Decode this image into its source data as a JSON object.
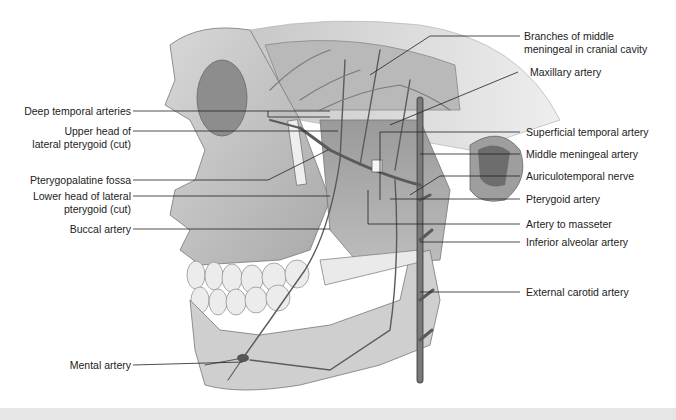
{
  "figure": {
    "type": "anatomical-illustration",
    "labels_left": [
      {
        "id": "deep-temporal",
        "lines": [
          "Deep temporal arteries"
        ]
      },
      {
        "id": "upper-head",
        "lines": [
          "Upper head of",
          "lateral pterygoid (cut)"
        ]
      },
      {
        "id": "pterygopalatine",
        "lines": [
          "Pterygopalatine fossa"
        ]
      },
      {
        "id": "lower-head",
        "lines": [
          "Lower head of lateral",
          "pterygoid (cut)"
        ]
      },
      {
        "id": "buccal",
        "lines": [
          "Buccal artery"
        ]
      },
      {
        "id": "mental",
        "lines": [
          "Mental artery"
        ]
      }
    ],
    "labels_right": [
      {
        "id": "branches-mm",
        "lines": [
          "Branches of middle",
          "meningeal in cranial cavity"
        ]
      },
      {
        "id": "maxillary",
        "lines": [
          "Maxillary artery"
        ]
      },
      {
        "id": "superficial-temporal",
        "lines": [
          "Superficial temporal artery"
        ]
      },
      {
        "id": "middle-meningeal",
        "lines": [
          "Middle meningeal artery"
        ]
      },
      {
        "id": "auriculotemporal",
        "lines": [
          "Auriculotemporal nerve"
        ]
      },
      {
        "id": "pterygoid",
        "lines": [
          "Pterygoid artery"
        ]
      },
      {
        "id": "masseter",
        "lines": [
          "Artery to masseter"
        ]
      },
      {
        "id": "inferior-alveolar",
        "lines": [
          "Inferior alveolar artery"
        ]
      },
      {
        "id": "external-carotid",
        "lines": [
          "External carotid artery"
        ]
      }
    ]
  }
}
